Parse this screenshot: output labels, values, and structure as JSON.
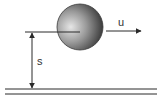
{
  "diagram": {
    "type": "physics-projectile",
    "ball": {
      "cx": 80,
      "cy": 27,
      "r": 23,
      "fill_light": "#dcdcdc",
      "fill_dark": "#3a3a3a"
    },
    "velocity": {
      "label": "u",
      "x1": 106,
      "x2": 141,
      "y": 31
    },
    "height": {
      "label": "s",
      "x": 32,
      "y1": 32,
      "y2": 89
    },
    "ground": {
      "x1": 5,
      "x2": 157,
      "y_top": 89,
      "y_bottom": 94
    },
    "colors": {
      "stroke": "#2a2a2a",
      "label": "#333333"
    }
  }
}
